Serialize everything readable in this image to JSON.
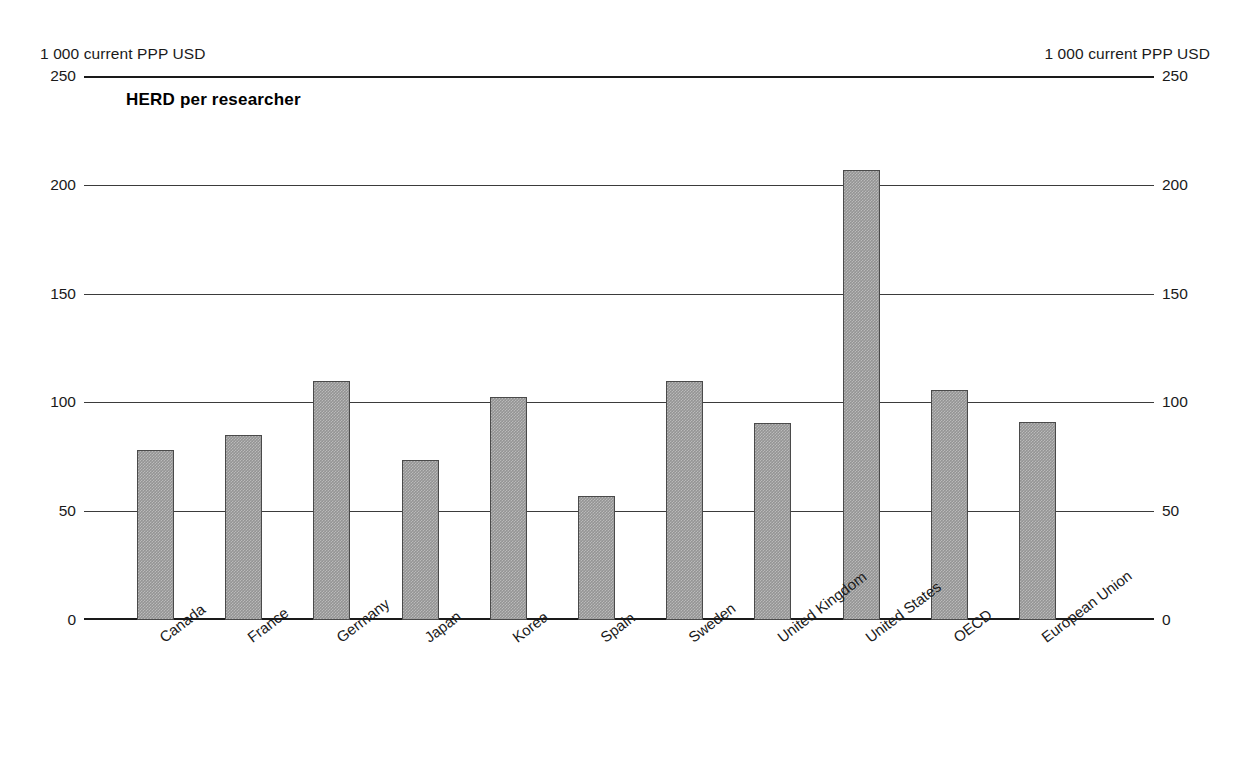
{
  "axis_units": {
    "left": "1 000 current PPP USD",
    "right": "1 000 current PPP USD"
  },
  "chart_data": {
    "type": "bar",
    "title": "HERD per researcher",
    "xlabel": "",
    "ylabel": "1 000 current PPP USD",
    "ylim": [
      0,
      250
    ],
    "yticks": [
      0,
      50,
      100,
      150,
      200,
      250
    ],
    "ytick_labels": [
      "0",
      "50",
      "100",
      "150",
      "200",
      "250"
    ],
    "grid": true,
    "legend": false,
    "dual_axis": true,
    "bar_color": "#949494",
    "bar_edge_color": "#4a4a4a",
    "categories": [
      "Canada",
      "France",
      "Germany",
      "Japan",
      "Korea",
      "Spain",
      "Sweden",
      "United Kingdom",
      "United States",
      "OECD",
      "European Union"
    ],
    "values": [
      78,
      85,
      110,
      73.5,
      102.5,
      57,
      110,
      90.5,
      207,
      105.5,
      91
    ]
  }
}
